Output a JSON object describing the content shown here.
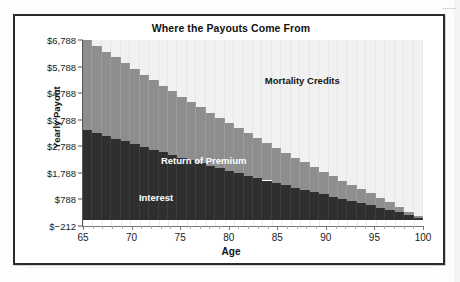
{
  "chart_data": {
    "type": "bar",
    "title": "Where the Payouts Come From",
    "xlabel": "Age",
    "ylabel": "Yearly Payout",
    "grid": true,
    "legend_position": "inline-annotations",
    "stacked": true,
    "ylim": [
      -212,
      6788
    ],
    "ytick_labels": [
      "$6,788",
      "$5,788",
      "$4,788",
      "$3,788",
      "$2,788",
      "$1,788",
      "$788",
      "$−212"
    ],
    "ytick_values": [
      6788,
      5788,
      4788,
      3788,
      2788,
      1788,
      788,
      -212
    ],
    "xlim": [
      65,
      100
    ],
    "xtick_labels": [
      "65",
      "70",
      "75",
      "80",
      "85",
      "90",
      "95",
      "100"
    ],
    "xtick_values": [
      65,
      70,
      75,
      80,
      85,
      90,
      95,
      100
    ],
    "categories": [
      65,
      66,
      67,
      68,
      69,
      70,
      71,
      72,
      73,
      74,
      75,
      76,
      77,
      78,
      79,
      80,
      81,
      82,
      83,
      84,
      85,
      86,
      87,
      88,
      89,
      90,
      91,
      92,
      93,
      94,
      95,
      96,
      97,
      98,
      99,
      100
    ],
    "series": [
      {
        "name": "Interest",
        "color": "#2f2f2f",
        "label_color": "#ffffff",
        "values": [
          3410,
          3300,
          3190,
          3080,
          2975,
          2870,
          2765,
          2660,
          2560,
          2460,
          2360,
          2260,
          2160,
          2060,
          1965,
          1870,
          1775,
          1680,
          1590,
          1500,
          1410,
          1320,
          1230,
          1145,
          1060,
          975,
          890,
          810,
          730,
          650,
          570,
          480,
          390,
          300,
          195,
          95
        ]
      },
      {
        "name": "Return of Premium",
        "color": "#8e8e8e",
        "label_color": "#ffffff",
        "values": [
          3378,
          3270,
          3160,
          3050,
          2940,
          2830,
          2720,
          2615,
          2510,
          2405,
          2300,
          2195,
          2095,
          1995,
          1895,
          1795,
          1700,
          1600,
          1505,
          1410,
          1315,
          1220,
          1130,
          1040,
          950,
          860,
          775,
          690,
          610,
          530,
          450,
          370,
          295,
          215,
          135,
          60
        ]
      },
      {
        "name": "Mortality Credits",
        "color": "#f1f1f1",
        "label_color": "#161616",
        "values": [
          0,
          218,
          438,
          658,
          873,
          1088,
          1303,
          1513,
          1718,
          1923,
          2128,
          2333,
          2533,
          2733,
          2928,
          3123,
          3313,
          3508,
          3693,
          3878,
          4063,
          4248,
          4428,
          4603,
          4778,
          4953,
          5123,
          5288,
          5448,
          5608,
          5768,
          5938,
          6103,
          6273,
          6458,
          6633
        ]
      }
    ],
    "total_at_start": 6788,
    "total_at_end": 6788
  },
  "annotations": {
    "mortality_credits": "Mortality Credits",
    "return_of_premium": "Return of Premium",
    "interest": "Interest"
  }
}
